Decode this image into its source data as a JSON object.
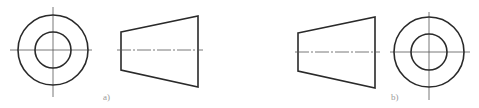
{
  "figure": {
    "views": [
      {
        "id": "a",
        "label": "a)",
        "circle_view": {
          "cx": 53,
          "cy": 50,
          "outer_r": 35,
          "inner_r": 18
        },
        "trapezoid_view": {
          "left_x": 121,
          "right_x": 198,
          "left_top": 32,
          "left_bottom": 70,
          "right_top": 16,
          "right_bottom": 87,
          "axis_y": 50
        }
      },
      {
        "id": "b",
        "label": "b)",
        "circle_view": {
          "cx": 429,
          "cy": 52,
          "outer_r": 35,
          "inner_r": 18
        },
        "trapezoid_view": {
          "left_x": 298,
          "right_x": 375,
          "left_top": 33,
          "left_bottom": 71,
          "right_top": 17,
          "right_bottom": 88,
          "axis_y": 52
        }
      }
    ],
    "colors": {
      "outline": "#2a2a2a",
      "centerline": "#555555",
      "label": "#9a9a9a"
    }
  }
}
